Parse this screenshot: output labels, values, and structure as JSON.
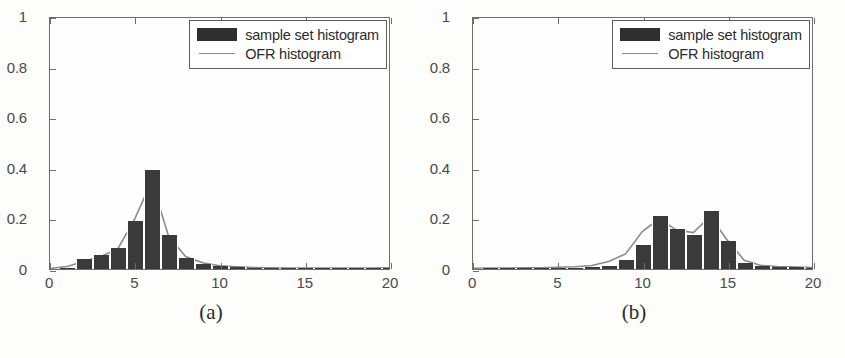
{
  "figure": {
    "panels": [
      {
        "caption": "(a)",
        "legend": {
          "position": "upper-right",
          "entries": [
            {
              "label": "sample set histogram",
              "marker": "filled-rect",
              "color": "#2f2f2f"
            },
            {
              "label": "OFR histogram",
              "marker": "line",
              "color": "#8a8a8a"
            }
          ]
        },
        "chart_data": {
          "type": "bar",
          "title": "",
          "xlabel": "",
          "ylabel": "",
          "xlim": [
            0,
            20
          ],
          "ylim": [
            0,
            1
          ],
          "xticks": [
            0,
            5,
            10,
            15,
            20
          ],
          "yticks": [
            0,
            0.2,
            0.4,
            0.6,
            0.8,
            1
          ],
          "xtick_labels": [
            "0",
            "5",
            "10",
            "15",
            "20"
          ],
          "ytick_labels": [
            "0",
            "0.2",
            "0.4",
            "0.6",
            "0.8",
            "1"
          ],
          "grid": false,
          "bar_width": 1,
          "series": [
            {
              "name": "sample set histogram",
              "type": "bar",
              "color": "#3a3a3a",
              "x": [
                1,
                2,
                3,
                4,
                5,
                6,
                7,
                8,
                9,
                10,
                11,
                12,
                13,
                14,
                15,
                16,
                17,
                18,
                19,
                20
              ],
              "values": [
                0.005,
                0.04,
                0.055,
                0.085,
                0.19,
                0.395,
                0.135,
                0.045,
                0.02,
                0.012,
                0.008,
                0.005,
                0.004,
                0.004,
                0.003,
                0.003,
                0.003,
                0.003,
                0.003,
                0.003
              ]
            },
            {
              "name": "OFR histogram",
              "type": "line",
              "color": "#8a8a8a",
              "x": [
                0,
                1,
                2,
                3,
                4,
                5,
                6,
                7,
                8,
                9,
                10,
                11,
                12,
                13,
                14,
                15,
                16,
                17,
                18,
                19,
                20
              ],
              "values": [
                0.002,
                0.01,
                0.03,
                0.05,
                0.08,
                0.2,
                0.35,
                0.13,
                0.05,
                0.025,
                0.013,
                0.009,
                0.006,
                0.005,
                0.004,
                0.004,
                0.004,
                0.004,
                0.004,
                0.004,
                0.005
              ]
            }
          ]
        }
      },
      {
        "caption": "(b)",
        "legend": {
          "position": "upper-right",
          "entries": [
            {
              "label": "sample set histogram",
              "marker": "filled-rect",
              "color": "#2f2f2f"
            },
            {
              "label": "OFR histogram",
              "marker": "line",
              "color": "#8a8a8a"
            }
          ]
        },
        "chart_data": {
          "type": "bar",
          "title": "",
          "xlabel": "",
          "ylabel": "",
          "xlim": [
            0,
            20
          ],
          "ylim": [
            0,
            1
          ],
          "xticks": [
            0,
            5,
            10,
            15,
            20
          ],
          "yticks": [
            0,
            0.2,
            0.4,
            0.6,
            0.8,
            1
          ],
          "xtick_labels": [
            "0",
            "5",
            "10",
            "15",
            "20"
          ],
          "ytick_labels": [
            "0",
            "0.2",
            "0.4",
            "0.6",
            "0.8",
            "1"
          ],
          "grid": false,
          "bar_width": 1,
          "series": [
            {
              "name": "sample set histogram",
              "type": "bar",
              "color": "#3a3a3a",
              "x": [
                1,
                2,
                3,
                4,
                5,
                6,
                7,
                8,
                9,
                10,
                11,
                12,
                13,
                14,
                15,
                16,
                17,
                18,
                19,
                20
              ],
              "values": [
                0.004,
                0.004,
                0.004,
                0.004,
                0.005,
                0.006,
                0.008,
                0.012,
                0.035,
                0.095,
                0.21,
                0.16,
                0.135,
                0.23,
                0.11,
                0.025,
                0.012,
                0.01,
                0.008,
                0.006
              ]
            },
            {
              "name": "OFR histogram",
              "type": "line",
              "color": "#8a8a8a",
              "x": [
                0,
                1,
                2,
                3,
                4,
                5,
                6,
                7,
                8,
                9,
                10,
                11,
                12,
                13,
                14,
                15,
                16,
                17,
                18,
                19,
                20
              ],
              "values": [
                0.003,
                0.004,
                0.004,
                0.005,
                0.005,
                0.007,
                0.009,
                0.014,
                0.03,
                0.06,
                0.15,
                0.2,
                0.155,
                0.145,
                0.21,
                0.115,
                0.035,
                0.014,
                0.01,
                0.008,
                0.006
              ]
            }
          ]
        }
      }
    ]
  }
}
